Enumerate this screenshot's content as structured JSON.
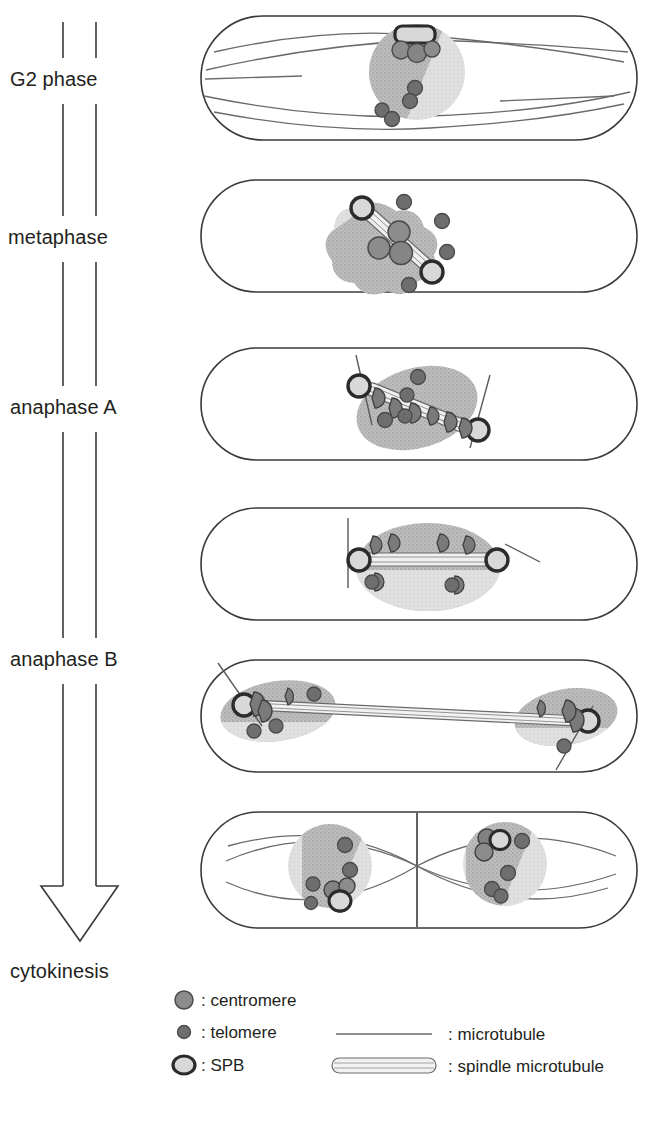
{
  "figure": {
    "timeline": {
      "name": "mitotic-progression-arrow",
      "direction": "downward",
      "style": "hollow-outlined-double-line-arrow"
    },
    "phases": [
      {
        "id": "g2",
        "label": "G2 phase",
        "order": 1
      },
      {
        "id": "metaphase",
        "label": "metaphase",
        "order": 2
      },
      {
        "id": "anaphase-a",
        "label": "anaphase A",
        "order": 3
      },
      {
        "id": "anaphase-b",
        "label": "anaphase B",
        "order": 4
      },
      {
        "id": "cytokinesis",
        "label": "cytokinesis",
        "order": 5
      }
    ],
    "cells": [
      {
        "id": "cell-g2",
        "phase": "G2 phase",
        "description": "Interphase rod-shaped cell with single nucleus, cytoplasmic microtubule bundles running along the long axis, SPB on nuclear envelope, clustered centromeres beneath SPB, telomeres dispersed.",
        "nuclei": 1,
        "spb_count": 1,
        "centromere_clusters": 1,
        "telomere_count": 4,
        "spindle": false
      },
      {
        "id": "cell-metaphase",
        "phase": "metaphase",
        "description": "Condensed nucleus with short diagonal spindle microtubule between two duplicated SPBs; centromeres aligned along the spindle; telomeres at nuclear periphery.",
        "nuclei": 1,
        "spb_count": 2,
        "centromere_clusters": 3,
        "telomere_count": 4,
        "spindle": true
      },
      {
        "id": "cell-anaphase-a",
        "phase": "anaphase A",
        "description": "Sister centromeres move poleward along the spindle toward the two SPBs; astral microtubules extend outward from each SPB.",
        "nuclei": 1,
        "spb_count": 2,
        "centromere_clusters": 6,
        "telomere_count": 3,
        "spindle": true
      },
      {
        "id": "cell-anaphase-a-late",
        "phase": "anaphase A",
        "description": "Spindle now horizontal; centromeres have clustered at both poles adjacent to the SPBs.",
        "nuclei": 1,
        "spb_count": 2,
        "centromere_clusters": 6,
        "telomere_count": 2,
        "spindle": true
      },
      {
        "id": "cell-anaphase-b",
        "phase": "anaphase B",
        "description": "Spindle elongates across the whole cell; two separated daughter nuclei at opposite poles, each with SPB, centromere cluster and telomeres; astral microtubules at both ends.",
        "nuclei": 2,
        "spb_count": 2,
        "centromere_clusters": 6,
        "telomere_count": 4,
        "spindle": true
      },
      {
        "id": "cell-cytokinesis",
        "phase": "cytokinesis",
        "description": "Division septum forms at cell middle; two daughter nuclei with reformed interphase microtubule arrays crossing at the septum; SPB, centromere cluster and telomeres in each nucleus.",
        "nuclei": 2,
        "spb_count": 2,
        "centromere_clusters": 2,
        "telomere_count": 6,
        "spindle": false,
        "septum": true
      }
    ],
    "legend": {
      "items": [
        {
          "id": "centromere",
          "symbol": "filled-gray-circle",
          "label": ": centromere"
        },
        {
          "id": "telomere",
          "symbol": "small-dark-circle",
          "label": ": telomere"
        },
        {
          "id": "spb",
          "symbol": "light-oval-dark-outline",
          "label": ": SPB"
        },
        {
          "id": "microtubule",
          "symbol": "thin-line",
          "label": ": microtubule"
        },
        {
          "id": "spindle-microtubule",
          "symbol": "striated-capsule",
          "label": ": spindle microtubule"
        }
      ]
    },
    "colors": {
      "outline": "#3a3a3a",
      "nucleus_dark": "#b4b4b4",
      "nucleus_light": "#dcdcdc",
      "centromere_fill": "#8c8c8c",
      "centromere_edge": "#4a4a4a",
      "telomere_fill": "#6e6e6e",
      "spb_fill": "#d2d2d2",
      "spb_edge": "#2b2b2b",
      "microtubule": "#5a5a5a",
      "text": "#231f20",
      "background": "#ffffff"
    }
  }
}
